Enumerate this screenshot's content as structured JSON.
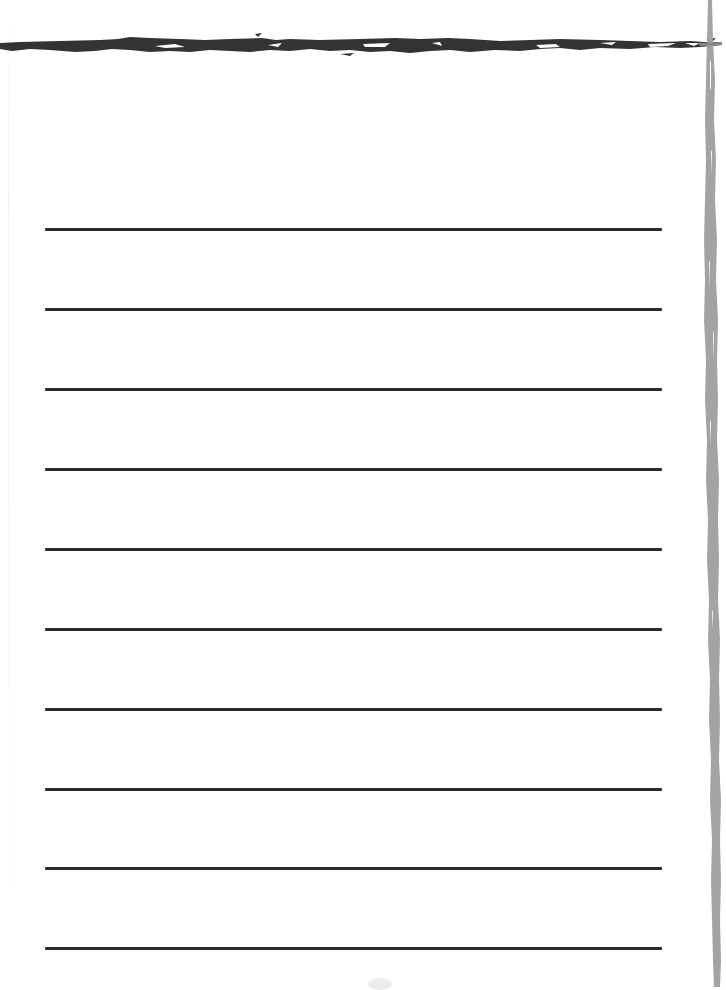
{
  "page": {
    "type": "lined-notepad-page",
    "background_color": "#ffffff",
    "top_border": {
      "style": "brush-stroke",
      "color": "#333333"
    },
    "right_border": {
      "style": "brush-stroke",
      "color": "#a0a0a0"
    },
    "ruled_lines": {
      "count": 10,
      "color": "#2b2b2b",
      "x_start": 45,
      "x_end": 662,
      "thickness": 3,
      "y_positions": [
        229,
        309,
        389,
        469,
        549,
        629,
        709,
        789,
        868,
        948
      ]
    }
  }
}
